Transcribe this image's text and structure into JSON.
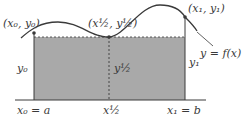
{
  "figure": {
    "colors": {
      "fill": "#a9a9a9",
      "stroke": "#3a3a3a",
      "axis": "#3a3a3a",
      "background": "#ffffff"
    }
  },
  "labels": {
    "left_point": "(x₀, y₀)",
    "mid_point": "(x½, y½)",
    "right_point": "(x₁, y₁)",
    "function": "y = f(x)",
    "left_height": "y₀",
    "mid_height": "y½",
    "right_height": "y₁",
    "left_x": "x₀ = a",
    "mid_x": "x½",
    "right_x": "x₁ = b"
  }
}
